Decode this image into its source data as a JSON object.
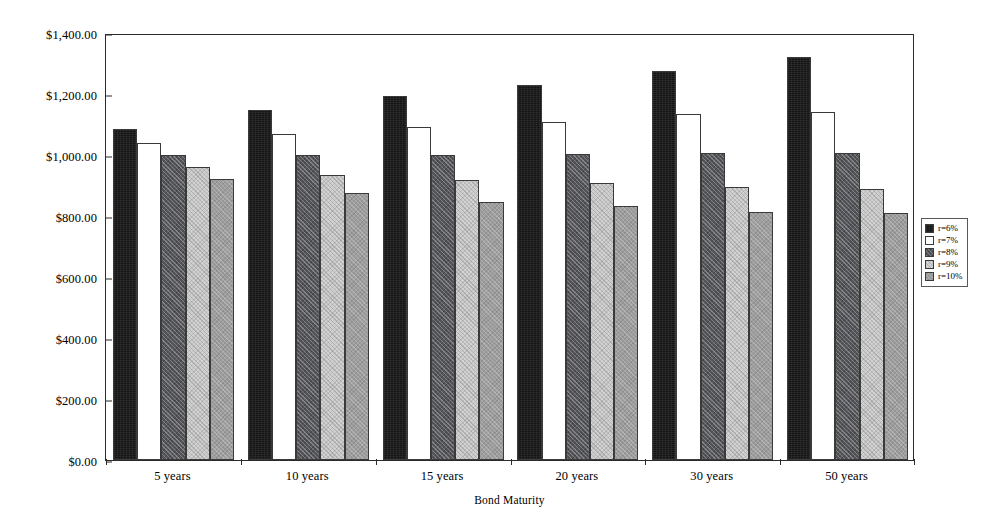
{
  "chart_data": {
    "type": "bar",
    "title": "",
    "xlabel": "Bond Maturity",
    "ylabel": "Value of Bond",
    "categories": [
      "5 years",
      "10 years",
      "15 years",
      "20 years",
      "30 years",
      "50 years"
    ],
    "ylim": [
      0,
      1400
    ],
    "ytick_values": [
      0,
      200,
      400,
      600,
      800,
      1000,
      1200,
      1400
    ],
    "ytick_labels": [
      "$0.00",
      "$200.00",
      "$400.00",
      "$600.00",
      "$800.00",
      "$1,000.00",
      "$1,200.00",
      "$1,400.00"
    ],
    "grid": false,
    "legend_position": "right",
    "series": [
      {
        "name": "r=6%",
        "swatch": "fill-black",
        "color": "#151515",
        "values": [
          1085,
          1149,
          1194,
          1229,
          1276,
          1321
        ]
      },
      {
        "name": "r=7%",
        "swatch": "fill-white",
        "color": "#ffffff",
        "values": [
          1041,
          1070,
          1091,
          1107,
          1133,
          1142
        ]
      },
      {
        "name": "r=8%",
        "swatch": "fill-darkgray",
        "color": "#55565a",
        "values": [
          1000,
          1000,
          1000,
          1003,
          1007,
          1007
        ]
      },
      {
        "name": "r=9%",
        "swatch": "fill-lightgray",
        "color": "#d2d2d2",
        "values": [
          961,
          935,
          919,
          908,
          895,
          890
        ]
      },
      {
        "name": "r=10%",
        "swatch": "fill-medgray",
        "color": "#9d9d9d",
        "values": [
          923,
          875,
          847,
          833,
          813,
          809
        ]
      }
    ]
  },
  "legend": {
    "items": [
      "r=6%",
      "r=7%",
      "r=8%",
      "r=9%",
      "r=10%"
    ]
  }
}
